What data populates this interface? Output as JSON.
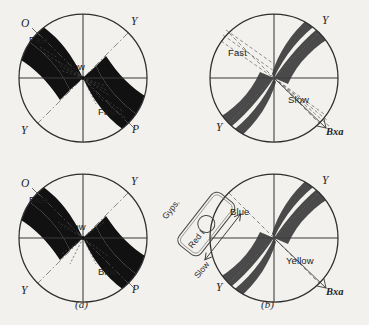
{
  "figure": {
    "background_color": "#f2f1ee",
    "ink_color": "#1a1a1a",
    "isogyre_black": "#111111",
    "isogyre_gray": "#4a4a4a",
    "line_color": "#3a3a3a"
  },
  "captions": [
    {
      "text": "(a)",
      "x": 75,
      "y": 303
    },
    {
      "text": "(b)",
      "x": 261,
      "y": 303
    }
  ],
  "panels": [
    {
      "id": "top-left",
      "name": "panel-a-uncompensated",
      "cx": 83,
      "cy": 78,
      "r": 64,
      "variant": "black-cross-open",
      "axis_labels": [
        {
          "text": "O",
          "x": 21,
          "y": 24,
          "name": "axis-label-o"
        },
        {
          "text": "Y",
          "x": 131,
          "y": 22,
          "name": "axis-label-y-top"
        },
        {
          "text": "Y",
          "x": 21,
          "y": 131,
          "name": "axis-label-y-bottom"
        },
        {
          "text": "P",
          "x": 132,
          "y": 130,
          "name": "axis-label-p"
        }
      ],
      "zone_labels": [
        {
          "text": "Fast",
          "x": 29,
          "y": 41,
          "name": "zone-label-fast-upper"
        },
        {
          "text": "Slow",
          "x": 68,
          "y": 68,
          "name": "zone-label-slow-center"
        },
        {
          "text": "Fast",
          "x": 98,
          "y": 113,
          "name": "zone-label-fast-lower"
        }
      ]
    },
    {
      "id": "top-right",
      "name": "panel-b-uncompensated",
      "cx": 274,
      "cy": 78,
      "r": 64,
      "variant": "gray-hyperbola-open",
      "axis_labels": [
        {
          "text": "Y",
          "x": 322,
          "y": 21,
          "name": "axis-label-y-top"
        },
        {
          "text": "Y",
          "x": 216,
          "y": 128,
          "name": "axis-label-y-bottom"
        },
        {
          "text": "Bxa",
          "x": 326,
          "y": 132,
          "name": "axis-label-bxa"
        }
      ],
      "zone_labels": [
        {
          "text": "Fast",
          "x": 230,
          "y": 54,
          "name": "zone-label-fast"
        },
        {
          "text": "Slow",
          "x": 289,
          "y": 101,
          "name": "zone-label-slow"
        }
      ]
    },
    {
      "id": "bottom-left",
      "name": "panel-a-compensated",
      "cx": 83,
      "cy": 238,
      "r": 64,
      "variant": "black-cross-open",
      "axis_labels": [
        {
          "text": "O",
          "x": 21,
          "y": 184,
          "name": "axis-label-o"
        },
        {
          "text": "Y",
          "x": 131,
          "y": 182,
          "name": "axis-label-y-top"
        },
        {
          "text": "Y",
          "x": 21,
          "y": 291,
          "name": "axis-label-y-bottom"
        },
        {
          "text": "P",
          "x": 132,
          "y": 290,
          "name": "axis-label-p"
        }
      ],
      "zone_labels": [
        {
          "text": "Blue",
          "x": 29,
          "y": 201,
          "name": "zone-label-blue-upper"
        },
        {
          "text": "Yellow",
          "x": 62,
          "y": 228,
          "name": "zone-label-yellow-center"
        },
        {
          "text": "Blue",
          "x": 98,
          "y": 273,
          "name": "zone-label-blue-lower"
        }
      ]
    },
    {
      "id": "bottom-right",
      "name": "panel-b-compensated",
      "cx": 274,
      "cy": 238,
      "r": 64,
      "variant": "gray-hyperbola-open",
      "axis_labels": [
        {
          "text": "Y",
          "x": 322,
          "y": 181,
          "name": "axis-label-y-top"
        },
        {
          "text": "Y",
          "x": 216,
          "y": 288,
          "name": "axis-label-y-bottom"
        },
        {
          "text": "Bxa",
          "x": 326,
          "y": 292,
          "name": "axis-label-bxa"
        }
      ],
      "zone_labels": [
        {
          "text": "Blue",
          "x": 232,
          "y": 213,
          "name": "zone-label-blue"
        },
        {
          "text": "Yellow",
          "x": 288,
          "y": 262,
          "name": "zone-label-yellow"
        }
      ]
    }
  ],
  "accessory_plate": {
    "name": "gypsum-plate",
    "labels": {
      "plate_name": "Gyps.",
      "retardation": "Red I",
      "direction": "Slow"
    }
  }
}
